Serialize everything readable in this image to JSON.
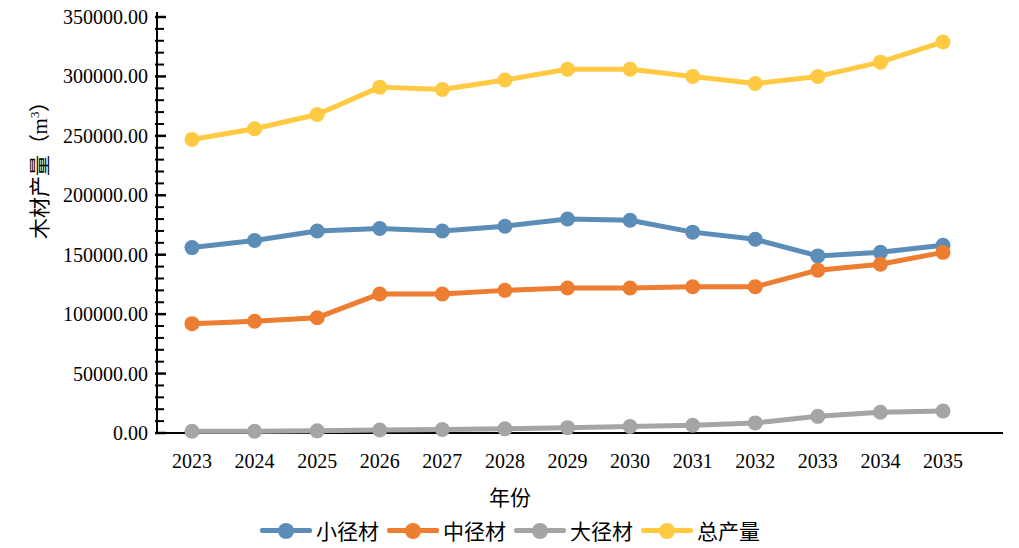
{
  "chart_data": {
    "type": "line",
    "title": "",
    "xlabel": "年份",
    "ylabel": "木材产量（m³）",
    "ylabel_main": "木材产量（m",
    "ylabel_sup": "3",
    "ylabel_tail": "）",
    "categories": [
      "2023",
      "2024",
      "2025",
      "2026",
      "2027",
      "2028",
      "2029",
      "2030",
      "2031",
      "2032",
      "2033",
      "2034",
      "2035"
    ],
    "ylim": [
      0,
      350000
    ],
    "ytick_step": 50000,
    "yticks": [
      0,
      50000,
      100000,
      150000,
      200000,
      250000,
      300000,
      350000
    ],
    "ytick_labels": [
      "0.00",
      "50000.00",
      "100000.00",
      "150000.00",
      "200000.00",
      "250000.00",
      "300000.00",
      "350000.00"
    ],
    "minor_ticks_per_interval": 5,
    "grid": false,
    "legend_position": "bottom",
    "series": [
      {
        "name": "小径材",
        "color": "#5B8DB8",
        "values": [
          156000,
          162000,
          170000,
          172000,
          170000,
          174000,
          180000,
          179000,
          169000,
          163000,
          149000,
          152000,
          158000
        ]
      },
      {
        "name": "中径材",
        "color": "#ED7D31",
        "values": [
          92000,
          94000,
          97000,
          117000,
          117000,
          120000,
          122000,
          122000,
          123000,
          123000,
          137000,
          142000,
          152000
        ]
      },
      {
        "name": "大径材",
        "color": "#A5A5A5",
        "values": [
          1500,
          1500,
          1800,
          2500,
          3000,
          3500,
          4500,
          5500,
          6500,
          8500,
          14000,
          17500,
          18500
        ]
      },
      {
        "name": "总产量",
        "color": "#FFC942",
        "values": [
          247000,
          256000,
          268000,
          291000,
          289000,
          297000,
          306000,
          306000,
          300000,
          294000,
          300000,
          312000,
          329000
        ]
      }
    ]
  },
  "axis": {
    "color": "#000000",
    "line_width": 2
  }
}
